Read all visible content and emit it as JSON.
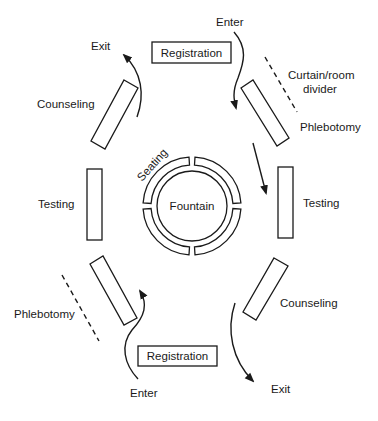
{
  "diagram": {
    "center": {
      "label": "Fountain",
      "ring_label": "Seating",
      "ring_segments": 4
    },
    "stations": {
      "registration_top": "Registration",
      "registration_bottom": "Registration",
      "phlebotomy_right": "Phlebotomy",
      "phlebotomy_left": "Phlebotomy",
      "testing_right": "Testing",
      "testing_left": "Testing",
      "counseling_right": "Counseling",
      "counseling_left": "Counseling"
    },
    "flow_labels": {
      "enter_top": "Enter",
      "exit_top": "Exit",
      "enter_bottom": "Enter",
      "exit_bottom": "Exit"
    },
    "divider_label_line1": "Curtain/room",
    "divider_label_line2": "divider"
  }
}
